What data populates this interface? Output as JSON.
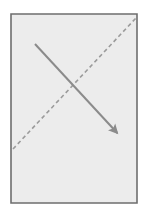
{
  "canvas": {
    "width": 148,
    "height": 215,
    "background_color": "#ffffff",
    "title": "Rectangle with diagonal arrow and dashed diagonal line"
  },
  "frame": {
    "name": "rectangle-panel",
    "x": 11,
    "y": 14,
    "width": 126,
    "height": 189,
    "fill_color": "#ececec",
    "border_color": "#6e6e6e",
    "border_width": 1.6
  },
  "shapes": {
    "solid_arrow": {
      "label": "solid-diagonal-arrow",
      "direction": "down-right",
      "x1": 35,
      "y1": 44,
      "x2": 120,
      "y2": 136,
      "color": "#8b8b8b",
      "stroke_width": 2,
      "arrowhead": "filled-triangle",
      "arrowhead_size": 9
    },
    "dashed_line": {
      "label": "dashed-diagonal-line",
      "direction": "up-right",
      "x1": 13,
      "y1": 149,
      "x2": 136,
      "y2": 18,
      "color": "#9b9b9b",
      "stroke_width": 1.6,
      "dash_pattern": "4 3"
    },
    "intersection": {
      "label": "lines-crossing-point",
      "x": 76,
      "y": 88
    }
  }
}
